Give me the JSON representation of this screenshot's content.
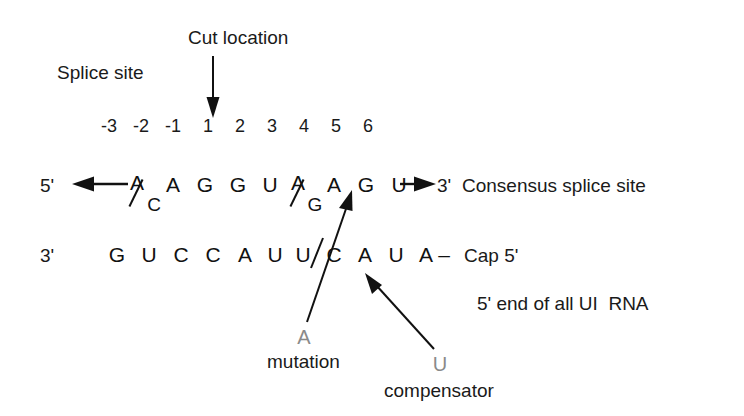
{
  "figure": {
    "title_annotations": {
      "splice_site": "Splice site",
      "cut_location": "Cut location"
    },
    "ruler": {
      "positions": [
        "-3",
        "-2",
        "-1",
        "1",
        "2",
        "3",
        "4",
        "5",
        "6"
      ]
    },
    "top_strand": {
      "left_terminus": "5'",
      "right_terminus": "3'",
      "caption": "Consensus splice site",
      "bases": [
        {
          "type": "fraction",
          "numerator": "A",
          "denominator": "C"
        },
        {
          "type": "single",
          "base": "A"
        },
        {
          "type": "single",
          "base": "G"
        },
        {
          "type": "single",
          "base": "G"
        },
        {
          "type": "single",
          "base": "U"
        },
        {
          "type": "fraction",
          "numerator": "A",
          "denominator": "G"
        },
        {
          "type": "single",
          "base": "A"
        },
        {
          "type": "single",
          "base": "G"
        },
        {
          "type": "single",
          "base": "U"
        }
      ]
    },
    "bottom_strand": {
      "left_terminus": "3'",
      "bases": [
        "G",
        "U",
        "C",
        "C",
        "A",
        "U",
        "U",
        "C",
        "A",
        "U",
        "A"
      ],
      "cap_dash": "–",
      "cap_label": "Cap 5'",
      "caption": "5' end of all UI  RNA"
    },
    "callouts": [
      {
        "id": "a-mutation",
        "letter": "A",
        "word": "mutation",
        "letter_color": "#8a8a8a"
      },
      {
        "id": "u-compensator",
        "letter": "U",
        "word": "compensator",
        "letter_color": "#8a8a8a"
      }
    ],
    "colors": {
      "ink": "#111111",
      "callout_gray": "#8a8a8a",
      "background": "#ffffff"
    }
  }
}
